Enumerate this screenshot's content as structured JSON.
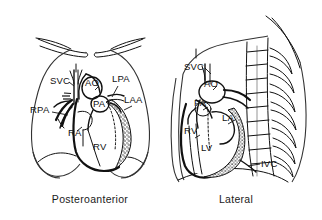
{
  "figure": {
    "background_color": "#ffffff",
    "ink_color": "#111111",
    "stipple_color": "#222222",
    "kind": "anatomical-line-drawing"
  },
  "panels": [
    {
      "id": "pa",
      "caption": "Posteroanterior",
      "labels": [
        {
          "key": "svc",
          "text": "SVC",
          "x": 50,
          "y": 84,
          "anchor": "start"
        },
        {
          "key": "ao",
          "text": "AO",
          "x": 85,
          "y": 86,
          "anchor": "start"
        },
        {
          "key": "lpa",
          "text": "LPA",
          "x": 112,
          "y": 82,
          "anchor": "start"
        },
        {
          "key": "pa",
          "text": "PA",
          "x": 93,
          "y": 102,
          "anchor": "start"
        },
        {
          "key": "laa",
          "text": "LAA",
          "x": 124,
          "y": 103,
          "anchor": "start"
        },
        {
          "key": "rpa",
          "text": "RPA",
          "x": 33,
          "y": 113,
          "anchor": "start"
        },
        {
          "key": "ra",
          "text": "RA",
          "x": 70,
          "y": 134,
          "anchor": "start"
        },
        {
          "key": "rv",
          "text": "RV",
          "x": 92,
          "y": 148,
          "anchor": "start"
        }
      ]
    },
    {
      "id": "lateral",
      "caption": "Lateral",
      "labels": [
        {
          "key": "svc",
          "text": "SVC",
          "x": 186,
          "y": 68,
          "anchor": "start"
        },
        {
          "key": "ao",
          "text": "AO",
          "x": 203,
          "y": 85,
          "anchor": "start"
        },
        {
          "key": "pa",
          "text": "PA",
          "x": 196,
          "y": 104,
          "anchor": "start"
        },
        {
          "key": "la",
          "text": "LA",
          "x": 224,
          "y": 118,
          "anchor": "start"
        },
        {
          "key": "rv",
          "text": "RV",
          "x": 187,
          "y": 132,
          "anchor": "start"
        },
        {
          "key": "lv",
          "text": "LV",
          "x": 203,
          "y": 148,
          "anchor": "start"
        },
        {
          "key": "ivc",
          "text": "IVC",
          "x": 262,
          "y": 163,
          "anchor": "start"
        }
      ]
    }
  ],
  "abbreviations": {
    "SVC": "superior vena cava",
    "IVC": "inferior vena cava",
    "AO": "aorta",
    "PA": "pulmonary artery",
    "RPA": "right pulmonary artery",
    "LPA": "left pulmonary artery",
    "LAA": "left atrial appendage",
    "RA": "right atrium",
    "RV": "right ventricle",
    "LA": "left atrium",
    "LV": "left ventricle"
  }
}
